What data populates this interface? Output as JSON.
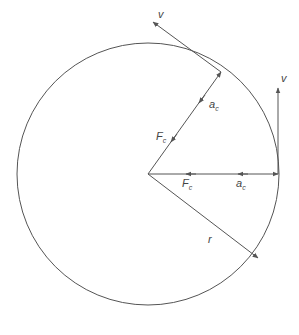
{
  "diagram": {
    "type": "uniform-circular-motion",
    "stroke_color": "#555555",
    "circle": {
      "cx": 148,
      "cy": 174,
      "r": 131
    },
    "labels": {
      "velocity_top": "v",
      "velocity_right": "v",
      "accel_diag_main": "a",
      "accel_diag_sub": "c",
      "force_diag_main": "F",
      "force_diag_sub": "c",
      "force_horiz_main": "F",
      "force_horiz_sub": "c",
      "accel_horiz_main": "a",
      "accel_horiz_sub": "c",
      "radius": "r"
    }
  }
}
